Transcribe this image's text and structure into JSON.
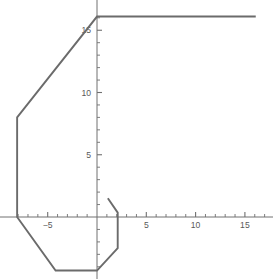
{
  "chart_data": {
    "type": "line",
    "title": "",
    "xlabel": "",
    "ylabel": "",
    "grid": false,
    "legend": null,
    "axes_style": "centered-spines",
    "xlim": [
      -8.9,
      17.9
    ],
    "ylim": [
      -5.1,
      17.4
    ],
    "x_ticks_major": [
      -5,
      5,
      10,
      15
    ],
    "x_tick_labels": [
      "−5",
      "5",
      "10",
      "15"
    ],
    "y_ticks_major": [
      5,
      10,
      15
    ],
    "y_tick_labels": [
      "5",
      "10",
      "15"
    ],
    "x_ticks_minor": [
      -8,
      -7,
      -6,
      -4,
      -3,
      -2,
      -1,
      1,
      2,
      3,
      4,
      6,
      7,
      8,
      9,
      11,
      12,
      13,
      14,
      16,
      17
    ],
    "y_ticks_minor": [
      -4,
      -3,
      -2,
      -1,
      1,
      2,
      3,
      4,
      6,
      7,
      8,
      9,
      11,
      12,
      13,
      14,
      16
    ],
    "series": [
      {
        "name": "curve",
        "color": "#6b6b6b",
        "linewidth": 1.9,
        "points": [
          [
            16.1,
            16.1
          ],
          [
            0.0,
            16.1
          ],
          [
            -8.1,
            8.0
          ],
          [
            -8.1,
            0.0
          ],
          [
            -4.2,
            -4.3
          ],
          [
            0.0,
            -4.3
          ],
          [
            2.1,
            -2.5
          ],
          [
            2.1,
            0.35
          ],
          [
            1.1,
            1.5
          ]
        ]
      }
    ],
    "axis_color": "#707070",
    "axis_linewidth": 1.0
  },
  "figure": {
    "background": "#ffffff",
    "width": 273,
    "height": 279
  }
}
